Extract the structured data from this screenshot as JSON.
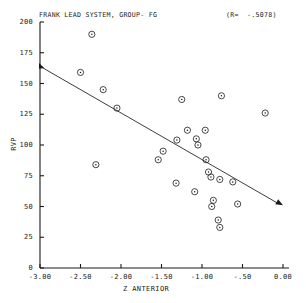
{
  "chart_data": {
    "type": "scatter",
    "title": "FRANK LEAD SYSTEM, GROUP- FG",
    "annotation": "(R=  -.5078)",
    "correlation": -0.5078,
    "xlabel": "Z ANTERIOR",
    "ylabel": "RVP",
    "xlim": [
      -3.0,
      0.0
    ],
    "ylim": [
      0,
      200
    ],
    "xticks": [
      -3.0,
      -2.5,
      -2.0,
      -1.5,
      -1.0,
      -0.5,
      0.0
    ],
    "xtick_labels": [
      "-3.00",
      "-2.50",
      "-2.00",
      "-1.50",
      "-1.00",
      "-.50",
      "0.00"
    ],
    "yticks": [
      0,
      25,
      50,
      75,
      100,
      125,
      150,
      175,
      200
    ],
    "ytick_labels": [
      "0",
      "25",
      "50",
      "75",
      "100",
      "125",
      "150",
      "175",
      "200"
    ],
    "grid": false,
    "legend": false,
    "marker": "open-circle-dot",
    "points": [
      {
        "x": -2.36,
        "y": 190
      },
      {
        "x": -2.5,
        "y": 159
      },
      {
        "x": -2.22,
        "y": 145
      },
      {
        "x": -2.05,
        "y": 130
      },
      {
        "x": -1.25,
        "y": 137
      },
      {
        "x": -0.76,
        "y": 140
      },
      {
        "x": -0.22,
        "y": 126
      },
      {
        "x": -1.18,
        "y": 112
      },
      {
        "x": -0.96,
        "y": 112
      },
      {
        "x": -1.31,
        "y": 104
      },
      {
        "x": -1.07,
        "y": 105
      },
      {
        "x": -1.05,
        "y": 100
      },
      {
        "x": -1.48,
        "y": 95
      },
      {
        "x": -1.54,
        "y": 88
      },
      {
        "x": -0.95,
        "y": 88
      },
      {
        "x": -2.31,
        "y": 84
      },
      {
        "x": -1.32,
        "y": 69
      },
      {
        "x": -0.92,
        "y": 78
      },
      {
        "x": -0.89,
        "y": 74
      },
      {
        "x": -0.78,
        "y": 72
      },
      {
        "x": -0.62,
        "y": 70
      },
      {
        "x": -1.09,
        "y": 62
      },
      {
        "x": -0.86,
        "y": 55
      },
      {
        "x": -0.88,
        "y": 50
      },
      {
        "x": -0.56,
        "y": 52
      },
      {
        "x": -0.8,
        "y": 39
      },
      {
        "x": -0.78,
        "y": 33
      }
    ],
    "regression_line": {
      "x_start": -3.0,
      "y_start": 164,
      "x_end": 0.0,
      "y_end": 51,
      "arrow_end": true,
      "marker_start": true
    }
  }
}
